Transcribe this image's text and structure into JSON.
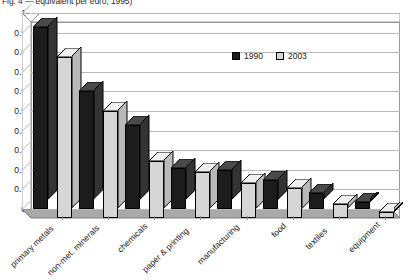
{
  "caption": "Fig. 4 — equivalent per euro, 1995)",
  "chart_data": {
    "type": "bar",
    "title": "",
    "subtitle": "",
    "xlabel": "",
    "ylabel": "",
    "ylim": [
      0,
      1
    ],
    "yticks": [
      "0",
      "0.1",
      "0.2",
      "0.3",
      "0.4",
      "0.5",
      "0.6",
      "0.7",
      "0.8",
      "0.9",
      "1"
    ],
    "grid": true,
    "legend_position": "inside-top-right",
    "categories": [
      "primary metals",
      "non-met. minerals",
      "chemicals",
      "paper & printing",
      "manufacturing",
      "food",
      "textiles",
      "equipment"
    ],
    "series": [
      {
        "name": "1990",
        "color": "#1c1c1c",
        "values": [
          0.93,
          0.6,
          0.43,
          0.21,
          0.2,
          0.15,
          0.08,
          0.035
        ]
      },
      {
        "name": "2003",
        "color": "#d6d6d6",
        "values": [
          0.82,
          0.545,
          0.29,
          0.235,
          0.18,
          0.155,
          0.07,
          0.03
        ]
      }
    ]
  }
}
